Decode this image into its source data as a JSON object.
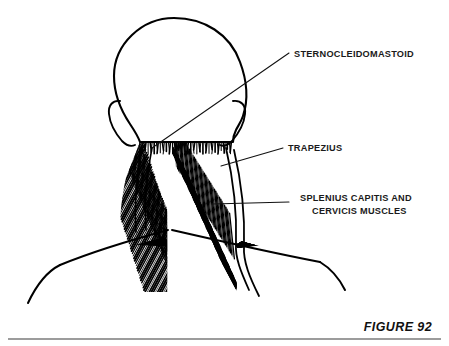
{
  "figure": {
    "caption": "FIGURE 92",
    "background_color": "#ffffff",
    "ink_color": "#000000",
    "text_color": "#1a1a1a"
  },
  "labels": [
    {
      "id": "sternocleidomastoid",
      "lines": [
        "STERNOCLEIDOMASTOID"
      ],
      "text_x": 294,
      "text_y": 57,
      "align": "start",
      "leader": {
        "x1": 289,
        "y1": 53,
        "x2": 152,
        "y2": 148
      }
    },
    {
      "id": "trapezius",
      "lines": [
        "TRAPEZIUS"
      ],
      "text_x": 288,
      "text_y": 151,
      "align": "start",
      "leader": {
        "x1": 283,
        "y1": 148,
        "x2": 221,
        "y2": 166
      }
    },
    {
      "id": "splenius-capitis-and-cervicis-muscles",
      "lines": [
        "SPLENIUS CAPITIS AND",
        "CERVICIS MUSCLES"
      ],
      "text_x": 300,
      "text_y": 201,
      "align": "start",
      "line_height": 13,
      "leader": {
        "x1": 289,
        "y1": 202,
        "x2": 212,
        "y2": 204
      }
    }
  ],
  "caption_block": {
    "text": "FIGURE 92",
    "x": 432,
    "y": 331,
    "rule": {
      "x1": 8,
      "y1": 339,
      "x2": 441,
      "y2": 339
    }
  },
  "anatomy": {
    "head": {
      "name": "skull-outline-posterior",
      "stroke_width": 2.0
    },
    "ears": [
      {
        "side": "left",
        "name": "ear-left"
      },
      {
        "side": "right",
        "name": "ear-right"
      }
    ],
    "muscle_regions": [
      {
        "name": "trapezius",
        "hatch": "radial-fan",
        "note": "broad diamond spanning shoulders"
      },
      {
        "name": "splenius-capitis-cervicis",
        "hatch": "diagonal",
        "note": "band beside midline"
      },
      {
        "name": "sternocleidomastoid",
        "hatch": "vertical-band",
        "note": "along lateral neck edge"
      }
    ],
    "midline": {
      "name": "nuchal-midline-stripe",
      "color": "#ffffff"
    }
  }
}
